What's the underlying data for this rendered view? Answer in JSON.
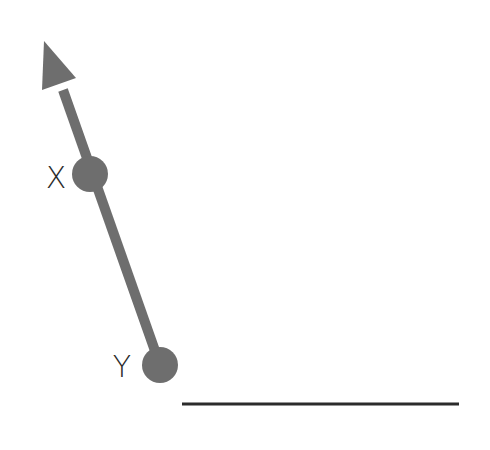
{
  "diagram": {
    "type": "geometry-vector",
    "colors": {
      "vector": "#6e6e6e",
      "points": "#6e6e6e",
      "labels": "#2b2b2b",
      "baseline": "#2b2b2b",
      "background": "#ffffff"
    },
    "vector": {
      "from_label": "Y",
      "through_label": "X",
      "direction": "up-left",
      "shaft_width": 10
    },
    "points": [
      {
        "label": "X",
        "cx": 90,
        "cy": 174,
        "r": 18,
        "label_x": 56,
        "label_y": 178
      },
      {
        "label": "Y",
        "cx": 160,
        "cy": 365,
        "r": 18,
        "label_x": 122,
        "label_y": 367
      }
    ],
    "baseline": {
      "x1": 182,
      "x2": 459,
      "y": 404,
      "thickness": 3
    }
  }
}
